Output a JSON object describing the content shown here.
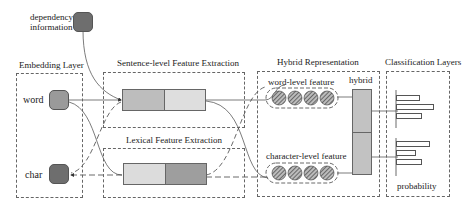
{
  "dependency": {
    "label_line1": "dependency",
    "label_line2": "information"
  },
  "embedding": {
    "title": "Embedding Layer",
    "word_label": "word",
    "char_label": "char"
  },
  "sentence": {
    "title": "Sentence-level Feature Extraction"
  },
  "lexical": {
    "title": "Lexical  Feature Extraction"
  },
  "hybrid": {
    "title": "Hybrid Representation",
    "word_feature_label": "word-level feature",
    "char_feature_label": "character-level feature",
    "hybrid_label": "hybrid"
  },
  "classification": {
    "title": "Classification Layers",
    "output_label": "probability",
    "bars_group1": [
      24,
      38,
      26
    ],
    "bars_group2": [
      34,
      20,
      26
    ]
  },
  "colors": {
    "light_gray": "#dcdcdc",
    "mid_gray": "#b5b5b5",
    "dark_gray": "#7a7a7a",
    "word_node": "#9a9a9a",
    "char_node": "#6e6e6e"
  }
}
